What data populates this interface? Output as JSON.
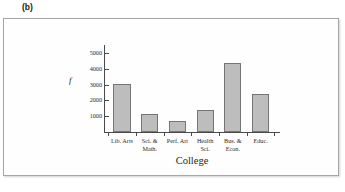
{
  "panel": {
    "label": "(b)"
  },
  "colors": {
    "bar_fill": "#bdbdbd",
    "bar_stroke": "#757575",
    "axis": "#4a4a4a",
    "frame_border": "#a8a6a3",
    "background": "#fefefe",
    "text": "#2b2b2b"
  },
  "chart_data": {
    "type": "bar",
    "title": "",
    "subtitle": "",
    "xlabel": "College",
    "ylabel": "f",
    "categories": [
      "Lib. Arts",
      "Sci. & Math.",
      "Perf. Art",
      "Health Sci.",
      "Bus. & Econ.",
      "Educ."
    ],
    "category_lines": [
      [
        "Lib. Arts"
      ],
      [
        "Sci. &",
        "Math."
      ],
      [
        "Perf. Art"
      ],
      [
        "Health",
        "Sci."
      ],
      [
        "Bus. &",
        "Econ."
      ],
      [
        "Educ."
      ]
    ],
    "values": [
      3050,
      1150,
      700,
      1400,
      4350,
      2400
    ],
    "ylim": [
      0,
      5500
    ],
    "yticks": [
      1000,
      2000,
      3000,
      4000,
      5000
    ],
    "ytick_labels": [
      "1000",
      "2000",
      "3000",
      "4000",
      "5000"
    ],
    "grid": false,
    "legend": null,
    "legend_position": "none",
    "annotations": []
  }
}
